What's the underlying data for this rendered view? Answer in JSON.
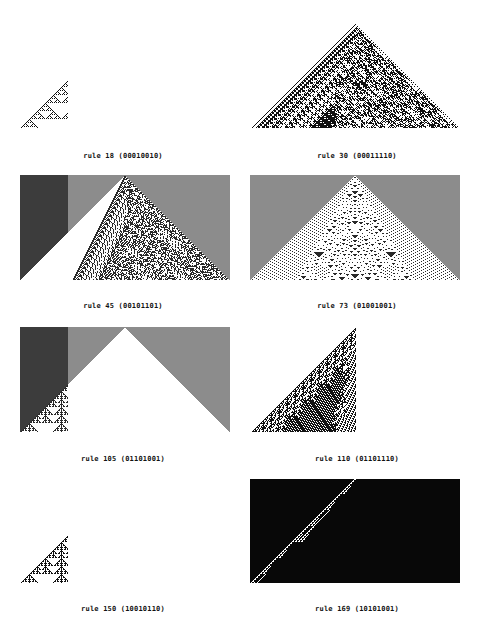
{
  "figure": {
    "panels": [
      {
        "rule": 18,
        "bits": "00010010",
        "caption": "rule 18 (00010010)",
        "background": "white",
        "shape": "full",
        "box": [
          20,
          23,
          210,
          105
        ],
        "cap_xy": [
          123,
          152
        ]
      },
      {
        "rule": 30,
        "bits": "00011110",
        "caption": "rule 30 (00011110)",
        "background": "white",
        "shape": "full",
        "box": [
          252,
          23,
          208,
          105
        ],
        "cap_xy": [
          357,
          152
        ]
      },
      {
        "rule": 45,
        "bits": "00101101",
        "caption": "rule 45 (00101101)",
        "background": "gray",
        "shape": "full",
        "box": [
          20,
          175,
          210,
          105
        ],
        "cap_xy": [
          123,
          302
        ]
      },
      {
        "rule": 73,
        "bits": "01001001",
        "caption": "rule 73 (01001001)",
        "background": "gray",
        "shape": "full",
        "box": [
          250,
          175,
          210,
          105
        ],
        "cap_xy": [
          357,
          302
        ]
      },
      {
        "rule": 105,
        "bits": "01101001",
        "caption": "rule 105 (01101001)",
        "background": "gray",
        "shape": "full",
        "box": [
          20,
          327,
          210,
          105
        ],
        "cap_xy": [
          123,
          455
        ]
      },
      {
        "rule": 110,
        "bits": "01101110",
        "caption": "rule 110 (01101110)",
        "background": "white",
        "shape": "left",
        "box": [
          252,
          327,
          208,
          105
        ],
        "cap_xy": [
          357,
          455
        ]
      },
      {
        "rule": 150,
        "bits": "10010110",
        "caption": "rule 150 (10010110)",
        "background": "white",
        "shape": "full",
        "box": [
          20,
          478,
          210,
          105
        ],
        "cap_xy": [
          123,
          605
        ]
      },
      {
        "rule": 169,
        "bits": "10101001",
        "caption": "rule 169 (10101001)",
        "background": "black",
        "shape": "full",
        "box": [
          250,
          478,
          210,
          105
        ],
        "cap_xy": [
          357,
          605
        ]
      }
    ]
  },
  "colors": {
    "on": "#111111",
    "off": "#ffffff",
    "gray_on": "#2a2a2a",
    "gray_off": "#8c8c8c"
  }
}
